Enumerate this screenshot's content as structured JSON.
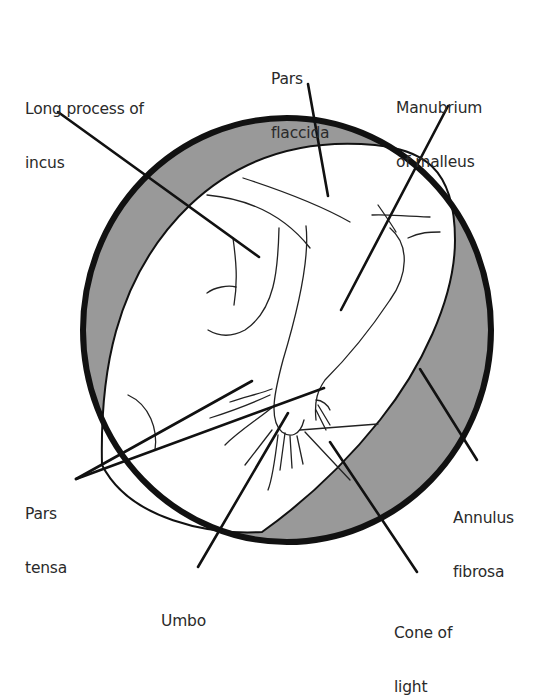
{
  "figure": {
    "type": "anatomical-diagram",
    "colors": {
      "outline": "#111111",
      "annulus_fill": "#999999",
      "membrane_fill": "#ffffff",
      "label_text": "#2a2a2a"
    }
  },
  "labels": {
    "long_process_of_incus": {
      "line1": "Long process of",
      "line2": "incus"
    },
    "pars_flaccida": {
      "line1": "Pars",
      "line2": "flaccida"
    },
    "manubrium_of_malleus": {
      "line1": "Manubrium",
      "line2": "of malleus"
    },
    "pars_tensa": {
      "line1": "Pars",
      "line2": "tensa"
    },
    "annulus_fibrosa": {
      "line1": "Annulus",
      "line2": "fibrosa"
    },
    "umbo": {
      "line1": "Umbo"
    },
    "cone_of_light": {
      "line1": "Cone of",
      "line2": "light"
    }
  }
}
